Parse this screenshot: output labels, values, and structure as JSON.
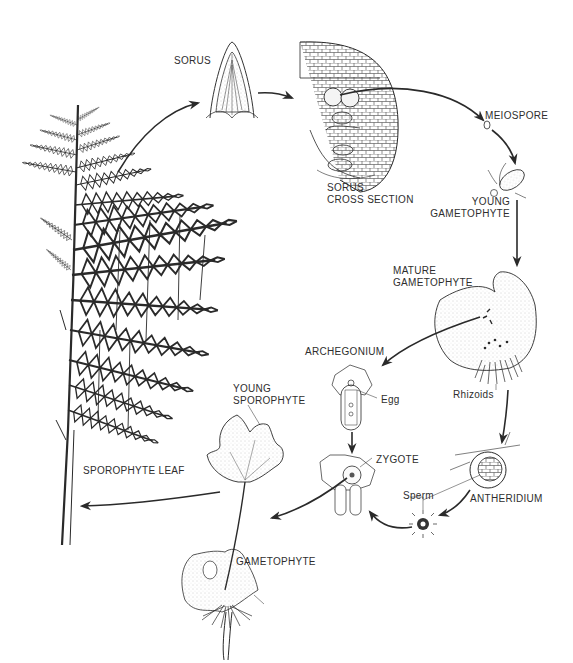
{
  "diagram": {
    "type": "life-cycle",
    "labels": {
      "sorus": "SORUS",
      "sorus_cross_section_1": "SORUS",
      "sorus_cross_section_2": "CROSS SECTION",
      "meiospore": "MEIOSPORE",
      "young_gametophyte_1": "YOUNG",
      "young_gametophyte_2": "GAMETOPHYTE",
      "mature_gametophyte_1": "MATURE",
      "mature_gametophyte_2": "GAMETOPHYTE",
      "rhizoids": "Rhizoids",
      "archegonium": "ARCHEGONIUM",
      "egg": "Egg",
      "antheridium": "ANTHERIDIUM",
      "sperm": "Sperm",
      "zygote": "ZYGOTE",
      "young_sporophyte_1": "YOUNG",
      "young_sporophyte_2": "SPOROPHYTE",
      "gametophyte": "GAMETOPHYTE",
      "sporophyte_leaf": "SPOROPHYTE LEAF"
    },
    "nodes": [
      {
        "id": "sporophyte_leaf",
        "label": "SPOROPHYTE LEAF"
      },
      {
        "id": "sorus",
        "label": "SORUS"
      },
      {
        "id": "sorus_cross_section",
        "label": "SORUS CROSS SECTION"
      },
      {
        "id": "meiospore",
        "label": "MEIOSPORE"
      },
      {
        "id": "young_gametophyte",
        "label": "YOUNG GAMETOPHYTE"
      },
      {
        "id": "mature_gametophyte",
        "label": "MATURE GAMETOPHYTE"
      },
      {
        "id": "archegonium",
        "label": "ARCHEGONIUM"
      },
      {
        "id": "antheridium",
        "label": "ANTHERIDIUM"
      },
      {
        "id": "sperm",
        "label": "Sperm"
      },
      {
        "id": "zygote",
        "label": "ZYGOTE"
      },
      {
        "id": "young_sporophyte",
        "label": "YOUNG SPOROPHYTE"
      }
    ],
    "edges": [
      {
        "from": "sporophyte_leaf",
        "to": "sorus"
      },
      {
        "from": "sorus",
        "to": "sorus_cross_section"
      },
      {
        "from": "sorus_cross_section",
        "to": "meiospore"
      },
      {
        "from": "meiospore",
        "to": "young_gametophyte"
      },
      {
        "from": "young_gametophyte",
        "to": "mature_gametophyte"
      },
      {
        "from": "mature_gametophyte",
        "to": "archegonium"
      },
      {
        "from": "mature_gametophyte",
        "to": "antheridium"
      },
      {
        "from": "antheridium",
        "to": "sperm"
      },
      {
        "from": "sperm",
        "to": "zygote"
      },
      {
        "from": "archegonium",
        "to": "zygote"
      },
      {
        "from": "zygote",
        "to": "young_sporophyte"
      },
      {
        "from": "young_sporophyte",
        "to": "sporophyte_leaf"
      }
    ],
    "colors": {
      "ink": "#2a2a2a",
      "stipple": "#8a8a8a",
      "background": "#ffffff"
    }
  }
}
